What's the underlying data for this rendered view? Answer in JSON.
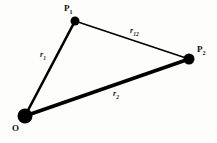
{
  "figure": {
    "type": "vector-triangle-diagram",
    "background_color": "#fdfdfc",
    "stroke_color": "#000000",
    "vertices": [
      {
        "id": "O",
        "label": "O",
        "subscript": "",
        "x": 25,
        "y": 116,
        "dot_radius": 7.5
      },
      {
        "id": "P1",
        "label": "P",
        "subscript": "1",
        "x": 75,
        "y": 21,
        "dot_radius": 4.5
      },
      {
        "id": "P2",
        "label": "P",
        "subscript": "2",
        "x": 189,
        "y": 59,
        "dot_radius": 5.5
      }
    ],
    "edges": [
      {
        "id": "r1",
        "label": "r",
        "subscript": "1",
        "from": "O",
        "to": "P1",
        "width": 2.6
      },
      {
        "id": "r2",
        "label": "r",
        "subscript": "2",
        "from": "O",
        "to": "P2",
        "width": 3.6
      },
      {
        "id": "r12",
        "label": "r",
        "subscript": "12",
        "from": "P1",
        "to": "P2",
        "width": 1.5
      }
    ],
    "labels": {
      "P1": "P",
      "P1_sub": "1",
      "P2": "P",
      "P2_sub": "2",
      "O": "O",
      "r1": "r",
      "r1_sub": "1",
      "r2": "r",
      "r2_sub": "2",
      "r12": "r",
      "r12_sub": "12"
    }
  }
}
